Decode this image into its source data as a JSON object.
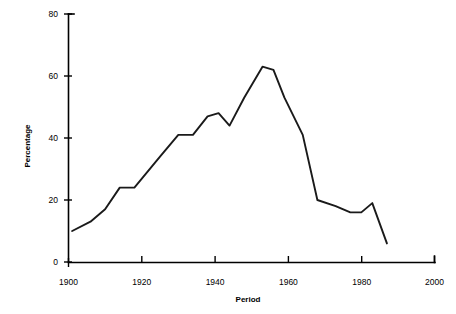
{
  "chart_data": {
    "type": "line",
    "title": "",
    "xlabel": "Period",
    "ylabel": "Percentage",
    "xlim": [
      1900,
      2000
    ],
    "ylim": [
      0,
      80
    ],
    "grid": false,
    "legend": null,
    "x_ticks": [
      1900,
      1920,
      1940,
      1960,
      1980,
      2000
    ],
    "y_ticks": [
      0,
      20,
      40,
      60,
      80
    ],
    "x_tick_labels": [
      "1900",
      "1920",
      "1940",
      "1960",
      "1980",
      "2000"
    ],
    "y_tick_labels": [
      "0",
      "20",
      "40",
      "60",
      "80"
    ],
    "series": [
      {
        "name": "Percentage",
        "color": "#1a1a1a",
        "x": [
          1901,
          1906,
          1910,
          1914,
          1918,
          1925,
          1930,
          1934,
          1938,
          1941,
          1944,
          1948,
          1953,
          1956,
          1959,
          1964,
          1968,
          1973,
          1977,
          1980,
          1983,
          1987
        ],
        "values": [
          10,
          13,
          17,
          24,
          24,
          34,
          41,
          41,
          47,
          48,
          44,
          53,
          63,
          62,
          53,
          41,
          20,
          18,
          16,
          16,
          19,
          6
        ]
      }
    ]
  },
  "axes": {
    "y_axis_title": "Percentage",
    "x_axis_title": "Period"
  }
}
